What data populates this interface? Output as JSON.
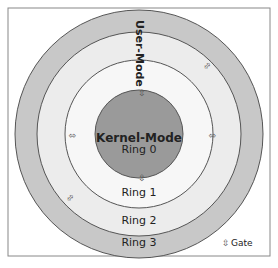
{
  "diagram": {
    "title_vertical": "User-Mode",
    "kernel_label": "Kernel-Mode",
    "rings": [
      {
        "label": "Ring 0",
        "color": "#9a9a9a"
      },
      {
        "label": "Ring 1",
        "color": "#f7f7f7"
      },
      {
        "label": "Ring 2",
        "color": "#ececec"
      },
      {
        "label": "Ring 3",
        "color": "#c8c8c8"
      }
    ],
    "legend": {
      "icon": "⇳",
      "label": "Gate"
    },
    "frame_color": "#888888"
  }
}
